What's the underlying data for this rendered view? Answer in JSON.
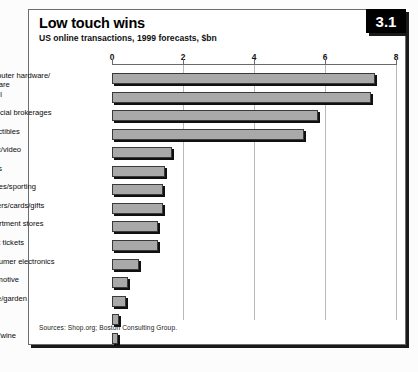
{
  "figure": {
    "number": "3.1",
    "title": "Low touch wins",
    "subtitle": "US online transactions, 1999 forecasts, $bn",
    "sources": "Sources: Shop.org; Boston Consulting Group."
  },
  "chart_data": {
    "type": "bar",
    "orientation": "horizontal",
    "title": "Low touch wins",
    "subtitle": "US online transactions, 1999 forecasts, $bn",
    "xlabel": "",
    "ylabel": "",
    "xlim": [
      0,
      8
    ],
    "xticks": [
      0,
      2,
      4,
      6,
      8
    ],
    "xtick_labels": [
      "0",
      "2",
      "4",
      "6",
      "8"
    ],
    "grid": "vertical",
    "legend": "none",
    "units": "$bn",
    "categories": [
      "Computer hardware/\nsoftware",
      "Travel",
      "Financial brokerages",
      "Collectibles",
      "Music/video",
      "Books",
      "Clothes/sporting",
      "Flowers/cards/gifts",
      "Department stores",
      "Event tickets",
      "Consumer electronics",
      "Automotive",
      "Home/garden",
      "Toys",
      "Food/wine"
    ],
    "values": [
      7.4,
      7.3,
      5.8,
      5.4,
      1.7,
      1.5,
      1.45,
      1.45,
      1.3,
      1.3,
      0.75,
      0.45,
      0.4,
      0.2,
      0.18
    ],
    "colors": {
      "bar_fill": "#a9a9a9",
      "bar_outline": "#3a3a3a",
      "bar_shadow": "#101010",
      "gridline": "#b9b9b9",
      "badge_background": "#000000",
      "badge_text": "#ffffff"
    }
  }
}
